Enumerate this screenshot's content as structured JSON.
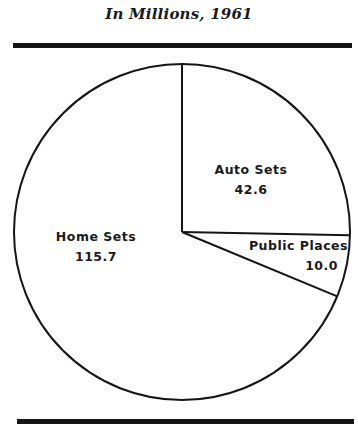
{
  "chart_data": {
    "type": "pie",
    "title": "In Millions, 1961",
    "unit": "millions",
    "categories": [
      "Auto Sets",
      "Public Places",
      "Home Sets"
    ],
    "values": [
      42.6,
      10.0,
      115.7
    ],
    "total": 168.3,
    "start_angle_deg": 0,
    "direction": "clockwise",
    "slices": [
      {
        "label": "Auto Sets",
        "value": "42.6"
      },
      {
        "label": "Public Places",
        "value": "10.0"
      },
      {
        "label": "Home Sets",
        "value": "115.7"
      }
    ],
    "legend": "none (inline labels)"
  },
  "colors": {
    "stroke": "#151515",
    "fill": "#ffffff",
    "text": "#1a1a1a"
  }
}
